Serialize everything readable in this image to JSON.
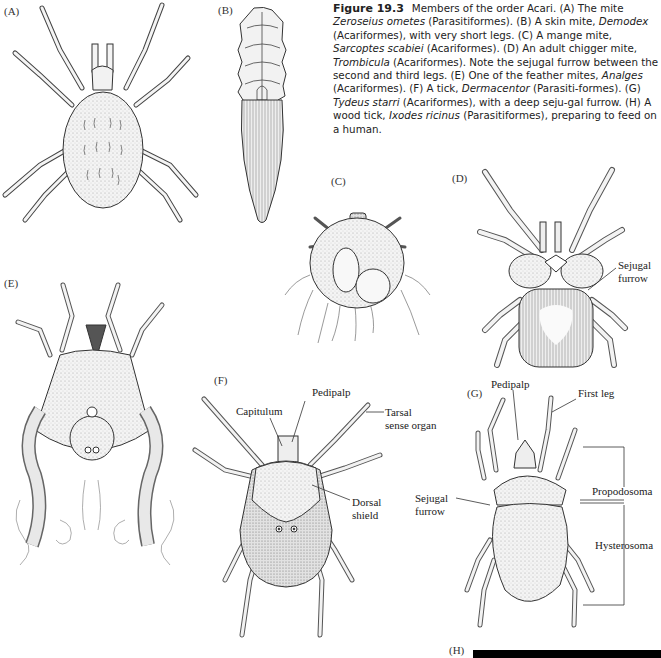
{
  "figure": {
    "number": "Figure 19.3",
    "caption_parts": [
      {
        "text": "Members of the order Acari. (A) The mite ",
        "style": "normal"
      },
      {
        "text": "Zeroseius ometes",
        "style": "italic"
      },
      {
        "text": " (Parasitiformes). (B) A skin mite, ",
        "style": "normal"
      },
      {
        "text": "Demodex",
        "style": "italic"
      },
      {
        "text": " (Acariformes), with very short legs. (C) A mange mite, ",
        "style": "normal"
      },
      {
        "text": "Sarcoptes scabiei",
        "style": "italic"
      },
      {
        "text": " (Acariformes). (D) An adult chigger mite, ",
        "style": "normal"
      },
      {
        "text": "Trombicula",
        "style": "italic"
      },
      {
        "text": " (Acariformes). Note the sejugal furrow between the second and third legs. (E) One of the feather mites, ",
        "style": "normal"
      },
      {
        "text": "Analges",
        "style": "italic"
      },
      {
        "text": " (Acariformes). (F) A tick, ",
        "style": "normal"
      },
      {
        "text": "Dermacentor",
        "style": "italic"
      },
      {
        "text": " (Parasiti-formes). (G) ",
        "style": "normal"
      },
      {
        "text": "Tydeus starri",
        "style": "italic"
      },
      {
        "text": " (Acariformes), with a deep seju-gal furrow. (H) A wood tick, ",
        "style": "normal"
      },
      {
        "text": "Ixodes ricinus",
        "style": "italic"
      },
      {
        "text": " (Parasitiformes), preparing to feed on a human.",
        "style": "normal"
      }
    ]
  },
  "panels": {
    "A": {
      "label": "(A)",
      "subject": "Zeroseius ometes mite"
    },
    "B": {
      "label": "(B)",
      "subject": "Demodex skin mite"
    },
    "C": {
      "label": "(C)",
      "subject": "Sarcoptes scabiei mange mite"
    },
    "D": {
      "label": "(D)",
      "subject": "Trombicula chigger mite",
      "callouts": {
        "sejugal": "Sejugal",
        "furrow": "furrow"
      }
    },
    "E": {
      "label": "(E)",
      "subject": "Analges feather mite"
    },
    "F": {
      "label": "(F)",
      "subject": "Dermacentor tick",
      "callouts": {
        "capitulum": "Capitulum",
        "pedipalp": "Pedipalp",
        "tarsal_1": "Tarsal",
        "tarsal_2": "sense organ",
        "dorsal_1": "Dorsal",
        "dorsal_2": "shield"
      }
    },
    "G": {
      "label": "(G)",
      "subject": "Tydeus starri",
      "callouts": {
        "pedipalp": "Pedipalp",
        "first_leg": "First leg",
        "sejugal": "Sejugal",
        "furrow": "furrow",
        "propodosoma": "Propodosoma",
        "hysterosoma": "Hysterosoma"
      }
    },
    "H": {
      "label": "(H)",
      "subject": "Ixodes ricinus wood tick (cropped)"
    }
  }
}
